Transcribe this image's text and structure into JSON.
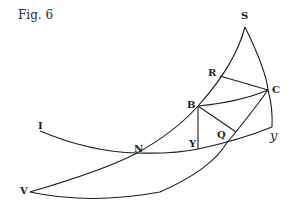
{
  "figure": {
    "title": "Fig. 6",
    "labels": {
      "S": "S",
      "R": "R",
      "C": "C",
      "B": "B",
      "I": "I",
      "N": "N",
      "Y": "Y",
      "Q": "Q",
      "y": "y",
      "V": "V"
    },
    "ink_color": "#1e1e1e",
    "background": "#ffffff"
  }
}
